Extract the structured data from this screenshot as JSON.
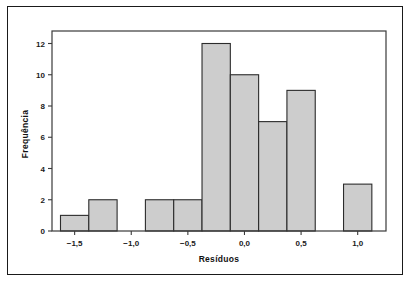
{
  "figure": {
    "background_color": "#ffffff",
    "border_color": "#1a1a1a",
    "bar_fill_color": "#cdcdcd",
    "bar_edge_color": "#2b2b2b",
    "axis_color": "#3a3a3a"
  },
  "chart_data": {
    "type": "bar",
    "title": "",
    "xlabel": "Resíduos",
    "ylabel": "Frequência",
    "xlim": [
      -1.7,
      1.25
    ],
    "ylim": [
      0,
      12.8
    ],
    "grid": false,
    "legend": null,
    "bin_width": 0.25,
    "xticks": [
      -1.5,
      -1.0,
      -0.5,
      0.0,
      0.5,
      1.0
    ],
    "xtick_labels": [
      "−1,5",
      "−1,0",
      "−0,5",
      "0,0",
      "0,5",
      "1,0"
    ],
    "yticks": [
      0,
      2,
      4,
      6,
      8,
      10,
      12
    ],
    "ytick_labels": [
      "0",
      "2",
      "4",
      "6",
      "8",
      "10",
      "12"
    ],
    "categories": [
      "-1,625 a -1,375",
      "-1,375 a -1,125",
      "-0,875 a -0,625",
      "-0,625 a -0,375",
      "-0,375 a -0,125",
      "-0,125 a 0,125",
      "0,125 a 0,375",
      "0,375 a 0,625",
      "0,875 a 1,125"
    ],
    "values": [
      1,
      2,
      2,
      2,
      12,
      10,
      7,
      9,
      3
    ],
    "bins": [
      {
        "left": -1.625,
        "right": -1.375,
        "value": 1
      },
      {
        "left": -1.375,
        "right": -1.125,
        "value": 2
      },
      {
        "left": -0.875,
        "right": -0.625,
        "value": 2
      },
      {
        "left": -0.625,
        "right": -0.375,
        "value": 2
      },
      {
        "left": -0.375,
        "right": -0.125,
        "value": 12
      },
      {
        "left": -0.125,
        "right": 0.125,
        "value": 10
      },
      {
        "left": 0.125,
        "right": 0.375,
        "value": 7
      },
      {
        "left": 0.375,
        "right": 0.625,
        "value": 9
      },
      {
        "left": 0.875,
        "right": 1.125,
        "value": 3
      }
    ]
  }
}
